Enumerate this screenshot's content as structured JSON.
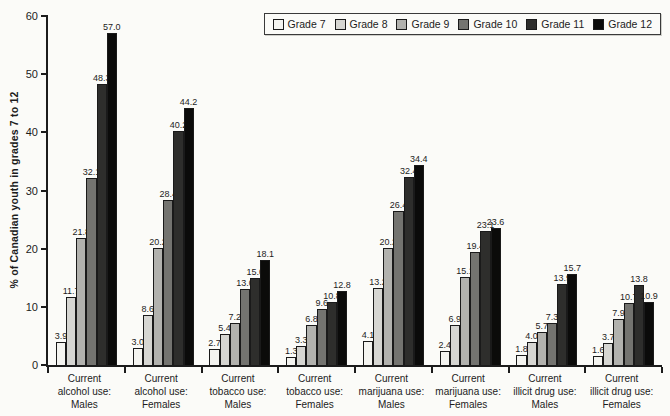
{
  "chart_data": {
    "type": "bar",
    "title": "",
    "xlabel": "",
    "ylabel": "% of Canadian youth in grades 7 to 12",
    "ylim": [
      0,
      60
    ],
    "yticks": [
      0,
      10,
      20,
      30,
      40,
      50,
      60
    ],
    "grid": false,
    "legend_position": "top-right",
    "categories": [
      "Current\nalcohol use:\nMales",
      "Current\nalcohol use:\nFemales",
      "Current\ntobacco use:\nMales",
      "Current\ntobacco use:\nFemales",
      "Current\nmarijuana use:\nMales",
      "Current\nmarijuana use:\nFemales",
      "Current\nillicit drug use:\nMales",
      "Current\nillicit drug use:\nFemales"
    ],
    "series": [
      {
        "name": "Grade 7",
        "color": "#f4f4f0",
        "values": [
          3.9,
          3.0,
          2.7,
          1.3,
          4.1,
          2.4,
          1.8,
          1.6
        ]
      },
      {
        "name": "Grade 8",
        "color": "#d6d6d2",
        "values": [
          11.7,
          8.6,
          5.4,
          3.3,
          13.2,
          6.9,
          4.0,
          3.7
        ]
      },
      {
        "name": "Grade 9",
        "color": "#b2b2ae",
        "values": [
          21.8,
          20.2,
          7.2,
          6.8,
          20.2,
          15.1,
          5.7,
          7.9
        ]
      },
      {
        "name": "Grade 10",
        "color": "#747470",
        "values": [
          32.1,
          28.4,
          13.0,
          9.6,
          26.4,
          19.4,
          7.3,
          10.7
        ]
      },
      {
        "name": "Grade 11",
        "color": "#2e2e2c",
        "values": [
          48.3,
          40.2,
          15.0,
          10.8,
          32.4,
          23.1,
          13.9,
          13.8
        ]
      },
      {
        "name": "Grade 12",
        "color": "#0b0b0a",
        "values": [
          57.0,
          44.2,
          18.1,
          12.8,
          34.4,
          23.6,
          15.7,
          10.9
        ]
      }
    ],
    "colors": {
      "axis": "#1c1c1c",
      "background": "#fbfbf8",
      "bar_border": "#1a1a1a"
    }
  }
}
